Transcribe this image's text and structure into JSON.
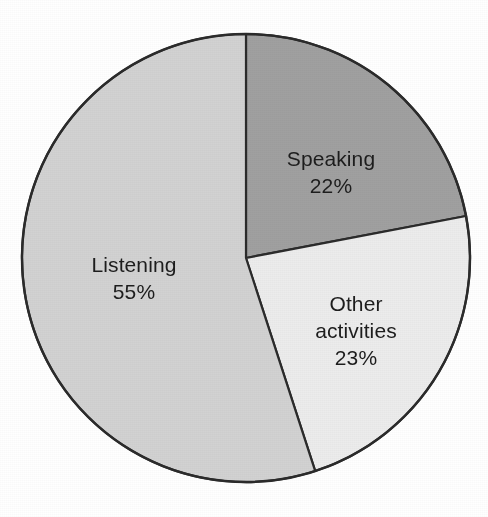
{
  "chart_data": {
    "type": "pie",
    "title": "",
    "subtitle": "",
    "xlabel": "",
    "ylabel": "",
    "legend_position": "none",
    "grid": false,
    "units": "percent",
    "start_angle_deg": 0,
    "direction": "clockwise",
    "categories": [
      "Speaking",
      "Other activities",
      "Listening"
    ],
    "values": [
      22,
      23,
      55
    ],
    "slices": [
      {
        "name": "Speaking",
        "label": "Speaking",
        "value": 22,
        "value_label": "22%",
        "color": "#a0a0a0",
        "start_angle_deg": 0,
        "end_angle_deg": 79.2,
        "label_x": 331,
        "label_y": 172
      },
      {
        "name": "Other activities",
        "label": "Other\nactivities",
        "label_line1": "Other",
        "label_line2": "activities",
        "value": 23,
        "value_label": "23%",
        "color": "#ececec",
        "start_angle_deg": 79.2,
        "end_angle_deg": 162.0,
        "label_x": 356,
        "label_y": 330
      },
      {
        "name": "Listening",
        "label": "Listening",
        "value": 55,
        "value_label": "55%",
        "color": "#d2d2d2",
        "start_angle_deg": 162.0,
        "end_angle_deg": 360.0,
        "label_x": 134,
        "label_y": 278
      }
    ],
    "geometry": {
      "center_x": 246,
      "center_y": 258,
      "radius": 224
    },
    "style": {
      "background": "#ffffff",
      "outline_color": "#2b2b2b",
      "label_color": "#1d1d1d"
    }
  }
}
